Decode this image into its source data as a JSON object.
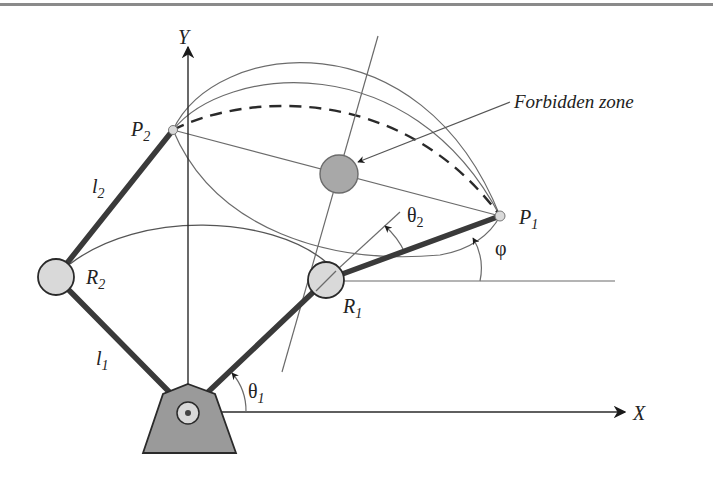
{
  "diagram": {
    "labels": {
      "y_axis": "Y",
      "x_axis": "X",
      "p1": "P",
      "p1_sub": "1",
      "p2": "P",
      "p2_sub": "2",
      "r1": "R",
      "r1_sub": "1",
      "r2": "R",
      "r2_sub": "2",
      "l1": "l",
      "l1_sub": "1",
      "l2": "l",
      "l2_sub": "2",
      "theta1": "θ",
      "theta1_sub": "1",
      "theta2": "θ",
      "theta2_sub": "2",
      "phi": "φ",
      "forbidden_zone": "Forbidden zone"
    },
    "colors": {
      "link": "#3a3a3a",
      "joint_fill": "#d9d9d9",
      "obstacle_fill": "#a8a8a8",
      "base_fill": "#9a9a9a",
      "line": "#6b6b6b",
      "text": "#222222"
    },
    "nodes": [
      {
        "id": "O",
        "role": "base-pivot"
      },
      {
        "id": "R1",
        "role": "joint"
      },
      {
        "id": "R2",
        "role": "joint"
      },
      {
        "id": "P1",
        "role": "end-effector-position"
      },
      {
        "id": "P2",
        "role": "end-effector-position"
      },
      {
        "id": "forbidden_zone",
        "role": "obstacle"
      }
    ],
    "edges": [
      {
        "from": "O",
        "to": "R1",
        "label": "link 1 (config 1)"
      },
      {
        "from": "R1",
        "to": "P1",
        "label": "link 2 (config 1)"
      },
      {
        "from": "O",
        "to": "R2",
        "label": "l1"
      },
      {
        "from": "R2",
        "to": "P2",
        "label": "l2"
      },
      {
        "from": "P2",
        "to": "P1",
        "label": "dashed path",
        "style": "dashed"
      }
    ]
  }
}
